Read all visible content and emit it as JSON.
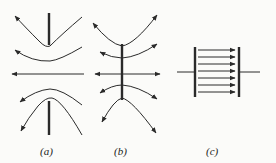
{
  "figure": {
    "panels": [
      {
        "id": "a",
        "label": "(a)",
        "description": "Two opposing rods (like charges) with field lines curving away from the gap, arrows pointing left"
      },
      {
        "id": "b",
        "label": "(b)",
        "description": "Single vertical rod with field lines radiating outward on both sides"
      },
      {
        "id": "c",
        "label": "(c)",
        "description": "Parallel plate capacitor with uniform field lines between plates"
      }
    ],
    "capacitor_field_line_count": 7,
    "colors": {
      "ink": "#2a2a2a",
      "background": "#fbfbf9"
    }
  }
}
